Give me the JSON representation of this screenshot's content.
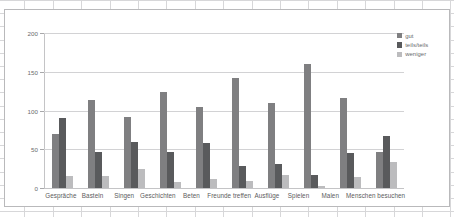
{
  "window": {
    "app_surface": "spreadsheet-grid"
  },
  "chart_data": {
    "type": "bar",
    "title": "",
    "subtitle": "",
    "xlabel": "",
    "ylabel": "",
    "ylim": [
      0,
      200
    ],
    "yticks": [
      0,
      50,
      100,
      150,
      200
    ],
    "ytick_labels": [
      "0",
      "50",
      "100",
      "150",
      "200"
    ],
    "grid": true,
    "legend_position": "right-top",
    "categories": [
      "Gespräche",
      "Basteln",
      "Singen",
      "Geschichten",
      "Beten",
      "Freunde treffen",
      "Ausflüge",
      "Spielen",
      "Malen",
      "Menschen besuchen"
    ],
    "series": [
      {
        "name": "gut",
        "color": "#7f7f81",
        "values": [
          70,
          113,
          91,
          124,
          104,
          142,
          110,
          160,
          116,
          47
        ]
      },
      {
        "name": "teils/teils",
        "color": "#595a5c",
        "values": [
          90,
          46,
          60,
          46,
          58,
          29,
          31,
          17,
          45,
          67
        ]
      },
      {
        "name": "weniger",
        "color": "#bcbcbe",
        "values": [
          15,
          16,
          24,
          8,
          12,
          9,
          17,
          2,
          14,
          34
        ]
      }
    ]
  }
}
